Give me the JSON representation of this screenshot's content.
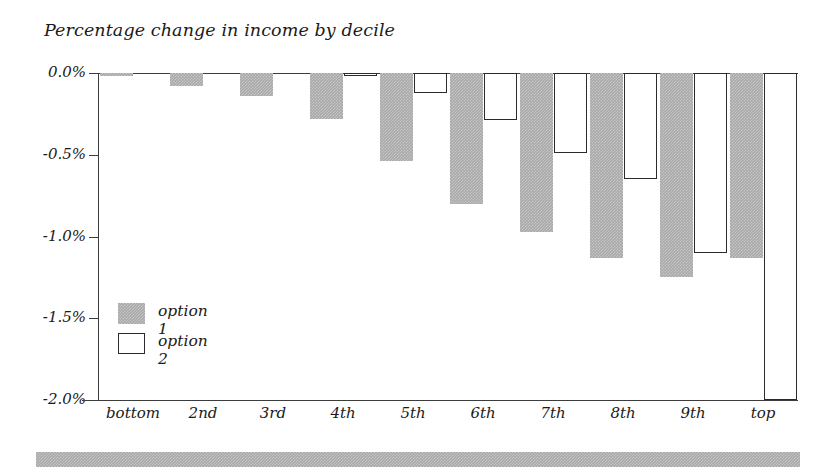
{
  "chart_data": {
    "type": "bar",
    "title": "Percentage change in income by decile",
    "xlabel": "",
    "ylabel": "",
    "ylim": [
      -2.0,
      0.0
    ],
    "grid": false,
    "legend_position": "inside-left",
    "categories": [
      "bottom",
      "2nd",
      "3rd",
      "4th",
      "5th",
      "6th",
      "7th",
      "8th",
      "9th",
      "top"
    ],
    "ytick_labels": [
      "0.0%",
      "-0.5%",
      "-1.0%",
      "-1.5%",
      "-2.0%"
    ],
    "ytick_values": [
      0.0,
      -0.5,
      -1.0,
      -1.5,
      -2.0
    ],
    "series": [
      {
        "name": "option 1",
        "color": "#a9a9a9",
        "style": "filled-gray",
        "values": [
          -0.02,
          -0.08,
          -0.14,
          -0.28,
          -0.54,
          -0.8,
          -0.97,
          -1.13,
          -1.25,
          -1.13
        ]
      },
      {
        "name": "option 2",
        "color": "#ffffff",
        "style": "white-outline",
        "values": [
          0.0,
          0.0,
          0.0,
          -0.02,
          -0.12,
          -0.29,
          -0.49,
          -0.65,
          -1.1,
          -2.0
        ]
      }
    ]
  },
  "legend": {
    "items": [
      {
        "label": "option 1"
      },
      {
        "label": "option 2"
      }
    ]
  },
  "colors": {
    "bar_fill": "#a9a9a9",
    "bar_outline": "#2b2b2b",
    "axis": "#3c3c3c",
    "text": "#1a1a1a",
    "background": "#ffffff"
  }
}
